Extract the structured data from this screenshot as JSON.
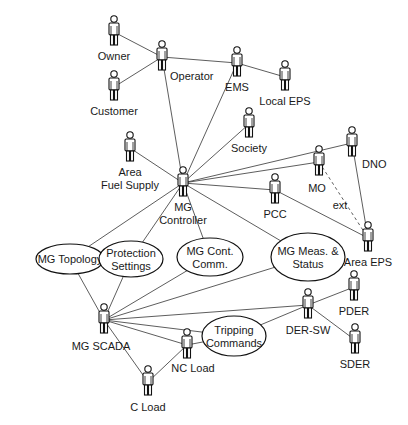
{
  "diagram": {
    "type": "use-case",
    "actors": [
      {
        "id": "owner",
        "label": "Owner",
        "x": 114,
        "y": 32,
        "label_lines": [
          "Owner"
        ]
      },
      {
        "id": "operator",
        "label": "Operator",
        "x": 162,
        "y": 57,
        "label_lines": [
          "Operator"
        ]
      },
      {
        "id": "customer",
        "label": "Customer",
        "x": 114,
        "y": 87,
        "label_lines": [
          "Customer"
        ]
      },
      {
        "id": "ems",
        "label": "EMS",
        "x": 237,
        "y": 63,
        "label_lines": [
          "EMS"
        ]
      },
      {
        "id": "local-eps",
        "label": "Local EPS",
        "x": 285,
        "y": 77,
        "label_lines": [
          "Local EPS"
        ]
      },
      {
        "id": "society",
        "label": "Society",
        "x": 249,
        "y": 124,
        "label_lines": [
          "Society"
        ]
      },
      {
        "id": "area-fuel-supply",
        "label": "Area Fuel Supply",
        "x": 130,
        "y": 148,
        "label_lines": [
          "Area",
          "Fuel Supply"
        ]
      },
      {
        "id": "mg-controller",
        "label": "MG Controller",
        "x": 183,
        "y": 183,
        "label_lines": [
          "MG",
          "Controller"
        ]
      },
      {
        "id": "dno",
        "label": "DNO",
        "x": 352,
        "y": 143,
        "label_lines": [
          "DNO"
        ]
      },
      {
        "id": "mo",
        "label": "MO",
        "x": 319,
        "y": 162,
        "label_lines": [
          "MO"
        ]
      },
      {
        "id": "pcc",
        "label": "PCC",
        "x": 275,
        "y": 190,
        "label_lines": [
          "PCC"
        ]
      },
      {
        "id": "area-eps",
        "label": "Area EPS",
        "x": 368,
        "y": 238,
        "label_lines": [
          "Area EPS"
        ]
      },
      {
        "id": "mg-scada",
        "label": "MG SCADA",
        "x": 104,
        "y": 320,
        "label_lines": [
          "MG SCADA"
        ]
      },
      {
        "id": "der-sw",
        "label": "DER-SW",
        "x": 308,
        "y": 305,
        "label_lines": [
          "DER-SW"
        ]
      },
      {
        "id": "pder",
        "label": "PDER",
        "x": 354,
        "y": 287,
        "label_lines": [
          "PDER"
        ]
      },
      {
        "id": "sder",
        "label": "SDER",
        "x": 355,
        "y": 340,
        "label_lines": [
          "SDER"
        ]
      },
      {
        "id": "nc-load",
        "label": "NC Load",
        "x": 187,
        "y": 345,
        "label_lines": [
          "NC Load"
        ]
      },
      {
        "id": "c-load",
        "label": "C Load",
        "x": 148,
        "y": 382,
        "label_lines": [
          "C Load"
        ]
      }
    ],
    "use_cases": [
      {
        "id": "mg-topology",
        "label": "MG Topology",
        "cx": 70,
        "cy": 259,
        "rx": 34,
        "ry": 15,
        "label_lines": [
          "MG Topology"
        ]
      },
      {
        "id": "protection-settings",
        "label": "Protection Settings",
        "cx": 131,
        "cy": 259,
        "rx": 32,
        "ry": 18,
        "label_lines": [
          "Protection",
          "Settings"
        ]
      },
      {
        "id": "mg-cont-comm",
        "label": "MG Cont. Comm.",
        "cx": 210,
        "cy": 257,
        "rx": 33,
        "ry": 19,
        "label_lines": [
          "MG Cont.",
          "Comm."
        ]
      },
      {
        "id": "mg-meas-status",
        "label": "MG Meas. & Status",
        "cx": 308,
        "cy": 257,
        "rx": 37,
        "ry": 24,
        "label_lines": [
          "MG Meas. &",
          "Status"
        ]
      },
      {
        "id": "tripping-commands",
        "label": "Tripping Commands",
        "cx": 234,
        "cy": 336,
        "rx": 32,
        "ry": 20,
        "label_lines": [
          "Tripping",
          "Commands"
        ]
      }
    ],
    "edges": [
      {
        "from": "owner",
        "to": "operator",
        "style": "solid"
      },
      {
        "from": "customer",
        "to": "operator",
        "style": "solid"
      },
      {
        "from": "operator",
        "to": "ems",
        "style": "solid"
      },
      {
        "from": "operator",
        "to": "mg-controller",
        "style": "solid"
      },
      {
        "from": "ems",
        "to": "local-eps",
        "style": "solid"
      },
      {
        "from": "ems",
        "to": "mg-controller",
        "style": "solid"
      },
      {
        "from": "society",
        "to": "mg-controller",
        "style": "solid"
      },
      {
        "from": "area-fuel-supply",
        "to": "mg-controller",
        "style": "solid"
      },
      {
        "from": "mg-controller",
        "to": "dno",
        "style": "solid"
      },
      {
        "from": "mg-controller",
        "to": "mo",
        "style": "solid"
      },
      {
        "from": "mg-controller",
        "to": "pcc",
        "style": "solid"
      },
      {
        "from": "mg-controller",
        "to": "mg-topology",
        "style": "solid"
      },
      {
        "from": "mg-controller",
        "to": "protection-settings",
        "style": "solid"
      },
      {
        "from": "mg-controller",
        "to": "mg-cont-comm",
        "style": "solid"
      },
      {
        "from": "mg-controller",
        "to": "mg-meas-status",
        "style": "solid"
      },
      {
        "from": "dno",
        "to": "area-eps",
        "style": "solid"
      },
      {
        "from": "pcc",
        "to": "area-eps",
        "style": "solid"
      },
      {
        "from": "mo",
        "to": "area-eps",
        "style": "dashed",
        "label": "ext"
      },
      {
        "from": "mg-topology",
        "to": "protection-settings",
        "style": "solid"
      },
      {
        "from": "mg-topology",
        "to": "mg-scada",
        "style": "solid"
      },
      {
        "from": "protection-settings",
        "to": "mg-scada",
        "style": "solid"
      },
      {
        "from": "mg-cont-comm",
        "to": "mg-scada",
        "style": "solid"
      },
      {
        "from": "mg-meas-status",
        "to": "mg-scada",
        "style": "solid"
      },
      {
        "from": "mg-scada",
        "to": "der-sw",
        "style": "solid"
      },
      {
        "from": "mg-scada",
        "to": "tripping-commands",
        "style": "solid"
      },
      {
        "from": "mg-scada",
        "to": "nc-load",
        "style": "solid"
      },
      {
        "from": "mg-scada",
        "to": "c-load",
        "style": "solid"
      },
      {
        "from": "tripping-commands",
        "to": "der-sw",
        "style": "solid"
      },
      {
        "from": "tripping-commands",
        "to": "nc-load",
        "style": "solid"
      },
      {
        "from": "nc-load",
        "to": "c-load",
        "style": "solid"
      },
      {
        "from": "der-sw",
        "to": "pder",
        "style": "solid"
      },
      {
        "from": "der-sw",
        "to": "sder",
        "style": "solid"
      }
    ],
    "edge_labels": [
      {
        "text": "ext",
        "x": 340,
        "y": 209
      }
    ],
    "colors": {
      "line": "#333333",
      "stroke": "#111111",
      "text": "#1a1a1a",
      "background": "#ffffff"
    }
  }
}
